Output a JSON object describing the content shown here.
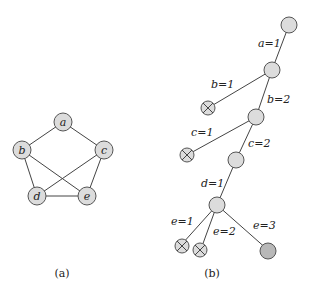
{
  "figure": {
    "panel_a": {
      "caption": "(a)",
      "nodes": [
        {
          "id": "a",
          "label": "a"
        },
        {
          "id": "b",
          "label": "b"
        },
        {
          "id": "c",
          "label": "c"
        },
        {
          "id": "d",
          "label": "d"
        },
        {
          "id": "e",
          "label": "e"
        }
      ],
      "edges": [
        [
          "a",
          "b"
        ],
        [
          "a",
          "c"
        ],
        [
          "b",
          "d"
        ],
        [
          "b",
          "e"
        ],
        [
          "c",
          "d"
        ],
        [
          "c",
          "e"
        ],
        [
          "d",
          "e"
        ]
      ]
    },
    "panel_b": {
      "caption": "(b)",
      "edge_labels": {
        "root_n1": "a=1",
        "n1_x1": "b=1",
        "n1_n2": "b=2",
        "n2_x2": "c=1",
        "n2_n3": "c=2",
        "n3_n4": "d=1",
        "n4_x3": "e=1",
        "n4_x4": "e=2",
        "n4_leaf": "e=3"
      },
      "node_types": {
        "pruned": "crossed-circle",
        "solution": "dark-circle",
        "internal": "light-circle"
      }
    },
    "colors": {
      "node_fill": "#dcdcdc",
      "solution_fill": "#b8b8b8",
      "stroke": "#555555"
    }
  }
}
